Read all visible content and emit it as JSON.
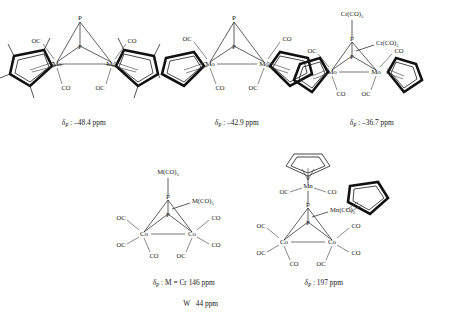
{
  "figure": {
    "type": "chemical-structure-diagram",
    "background_color": "#ffffff",
    "line_color": "#2b2b2b"
  },
  "structures": [
    {
      "id": "struct-1",
      "name": "bis(pentamethylcyclopentadienyl) dimolybdenum diphosphorus tetracarbonyl",
      "core_atoms": [
        "P",
        "P",
        "Mo",
        "Mo"
      ],
      "labels": {
        "p_top": "P",
        "p_bottom": "P",
        "metal_left": "Mo",
        "metal_right": "Mo",
        "co_upper_left": "OC",
        "co_lower_left": "CO",
        "co_upper_right": "CO",
        "co_lower_right": "OC"
      },
      "ring_type": "Cp*",
      "ring_methyl_count": 5,
      "caption_delta": "δ",
      "caption_sub": "P",
      "caption_value": " : –48.4 ppm",
      "shift_ppm": -48.4
    },
    {
      "id": "struct-2",
      "name": "bis(cyclopentadienyl) dimolybdenum diphosphorus tetracarbonyl",
      "core_atoms": [
        "P",
        "P",
        "Mo",
        "Mo"
      ],
      "labels": {
        "p_top": "P",
        "p_bottom": "P",
        "metal_left": "Mo",
        "metal_right": "Mo",
        "co_upper_left": "OC",
        "co_lower_left": "CO",
        "co_upper_right": "CO",
        "co_lower_right": "OC"
      },
      "ring_type": "Cp",
      "ring_methyl_count": 0,
      "caption_delta": "δ",
      "caption_sub": "P",
      "caption_value": " : –42.9 ppm",
      "shift_ppm": -42.9
    },
    {
      "id": "struct-3",
      "name": "dimolybdenum diphosphorus cluster with two chromium pentacarbonyl groups",
      "core_atoms": [
        "P",
        "P",
        "Mo",
        "Mo"
      ],
      "labels": {
        "p_top": "P",
        "p_bottom": "P",
        "metal_left": "Mo",
        "metal_right": "Mo",
        "co_upper_left": "OC",
        "co_lower_left": "CO",
        "co_upper_right": "CO",
        "co_lower_right": "OC",
        "adduct_top": "Cr(CO)",
        "adduct_top_sub": "5",
        "adduct_mid": "Cr(CO)",
        "adduct_mid_sub": "5"
      },
      "ring_type": "Cp",
      "ring_methyl_count": 0,
      "caption_delta": "δ",
      "caption_sub": "P",
      "caption_value": " : –36.7 ppm",
      "shift_ppm": -36.7
    },
    {
      "id": "struct-4",
      "name": "dicobalt hexacarbonyl diphosphorus cluster with two M(CO)5 groups",
      "core_atoms": [
        "P",
        "P",
        "Co",
        "Co"
      ],
      "labels": {
        "p_top": "P",
        "p_bottom": "P",
        "metal_left": "Co",
        "metal_right": "Co",
        "co_left_upper": "OC",
        "co_left_lower": "OC",
        "co_left_bottom": "CO",
        "co_right_upper": "CO",
        "co_right_lower": "CO",
        "co_right_bottom": "OC",
        "adduct_top": "M(CO)",
        "adduct_top_sub": "5",
        "adduct_mid": "M(CO)",
        "adduct_mid_sub": "5"
      },
      "caption_delta": "δ",
      "caption_sub": "P",
      "caption_value": " : M = Cr 146 ppm",
      "caption_line2": "W   44 ppm",
      "shift_ppm_cr": 146,
      "shift_ppm_w": 44
    },
    {
      "id": "struct-5",
      "name": "dicobalt hexacarbonyl diphosphorus cluster with CpMn(CO)2 groups",
      "core_atoms": [
        "P",
        "P",
        "Co",
        "Co"
      ],
      "labels": {
        "p_top": "P",
        "p_bottom": "P",
        "metal_left": "Co",
        "metal_right": "Co",
        "mn_top": "Mn",
        "co_mn_left": "OC",
        "co_mn_right": "CO",
        "co_left_upper": "OC",
        "co_left_lower": "OC",
        "co_left_bottom": "CO",
        "co_right_upper": "CO",
        "co_right_lower": "CO",
        "co_right_bottom": "OC",
        "adduct_side": "Mn(CO)",
        "adduct_side_sub": "2"
      },
      "ring_type": "Cp",
      "caption_delta": "δ",
      "caption_sub": "P",
      "caption_value": " : 197 ppm",
      "shift_ppm": 197
    }
  ]
}
